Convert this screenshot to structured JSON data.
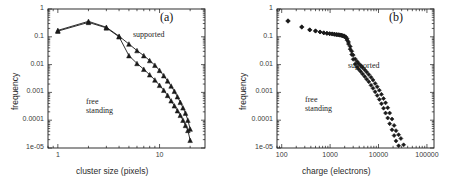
{
  "figure": {
    "background": "#ffffff",
    "ink_color": "#1a1a1a"
  },
  "chart_data": [
    {
      "type": "line",
      "panel_label": "(a)",
      "title": "",
      "xlabel": "cluster size (pixels)",
      "ylabel": "frequency",
      "xscale": "log",
      "yscale": "log",
      "xlim": [
        0.8,
        28
      ],
      "ylim": [
        1e-05,
        1
      ],
      "xticks": [
        1,
        10
      ],
      "xtick_labels": [
        "1",
        "10"
      ],
      "yticks": [
        1,
        0.1,
        0.01,
        0.001,
        0.0001,
        1e-05
      ],
      "ytick_labels": [
        "1",
        "0.1",
        "0.01",
        "0.001",
        "0.0001",
        "1e-05"
      ],
      "grid": false,
      "legend_position": "inline-annotation",
      "annotations": [
        {
          "text": "supported",
          "x": 7.0,
          "y": 0.12
        },
        {
          "text": "free\nstanding",
          "x": 4.0,
          "y": 0.0013
        }
      ],
      "marker": "triangle",
      "series": [
        {
          "name": "supported",
          "x": [
            1,
            2,
            3,
            4,
            5,
            6,
            7,
            8,
            9,
            10,
            11,
            12,
            13,
            14,
            15,
            16,
            17,
            18,
            19,
            20
          ],
          "values": [
            0.17,
            0.36,
            0.22,
            0.105,
            0.055,
            0.032,
            0.021,
            0.014,
            0.0095,
            0.0062,
            0.004,
            0.0026,
            0.0017,
            0.0011,
            0.0007,
            0.00044,
            0.00028,
            0.00018,
            0.0001,
            4.8e-05
          ]
        },
        {
          "name": "free standing",
          "x": [
            1,
            2,
            3,
            4,
            5,
            6,
            7,
            8,
            9,
            10,
            11,
            12,
            13,
            14,
            15,
            16,
            17,
            18,
            19,
            20
          ],
          "values": [
            0.16,
            0.33,
            0.21,
            0.1,
            0.021,
            0.011,
            0.0068,
            0.0043,
            0.0028,
            0.0018,
            0.0012,
            0.00078,
            0.0005,
            0.00033,
            0.00022,
            0.00015,
            0.0001,
            6.5e-05,
            4.3e-05,
            1.9e-05
          ]
        }
      ]
    },
    {
      "type": "scatter",
      "panel_label": "(b)",
      "title": "",
      "xlabel": "charge (electrons)",
      "ylabel": "frequency",
      "xscale": "log",
      "yscale": "log",
      "xlim": [
        80,
        140000
      ],
      "ylim": [
        1e-05,
        1
      ],
      "xticks": [
        100,
        1000,
        10000,
        100000
      ],
      "xtick_labels": [
        "100",
        "1000",
        "10000",
        "100000"
      ],
      "yticks": [
        1,
        0.1,
        0.01,
        0.001,
        0.0001,
        1e-05
      ],
      "ytick_labels": [
        "1",
        "0.1",
        "0.01",
        "0.001",
        "0.0001",
        "1e-05"
      ],
      "grid": false,
      "legend_position": "inline-annotation",
      "annotations": [
        {
          "text": "supported",
          "x": 9000,
          "y": 0.011
        },
        {
          "text": "free\nstanding",
          "x": 3100,
          "y": 0.0011
        }
      ],
      "marker": "diamond",
      "series": [
        {
          "name": "supported",
          "x": [
            135,
            260,
            380,
            500,
            620,
            740,
            860,
            980,
            1100,
            1220,
            1340,
            1460,
            1580,
            1700,
            1820,
            1950,
            2100,
            2250,
            2400,
            2600,
            2800,
            3000,
            3300,
            3600,
            3900,
            4300,
            4700,
            5200,
            5700,
            6300,
            7000,
            7700,
            8500,
            9400,
            10400,
            11500,
            12700,
            14000,
            15500,
            17000,
            19000,
            21000,
            23000,
            26000,
            29000,
            33000
          ],
          "values": [
            0.38,
            0.23,
            0.18,
            0.165,
            0.15,
            0.14,
            0.135,
            0.13,
            0.128,
            0.125,
            0.122,
            0.12,
            0.118,
            0.115,
            0.112,
            0.108,
            0.1,
            0.085,
            0.065,
            0.045,
            0.03,
            0.022,
            0.016,
            0.013,
            0.011,
            0.0092,
            0.0078,
            0.0065,
            0.0054,
            0.0044,
            0.0035,
            0.0028,
            0.0021,
            0.0016,
            0.0012,
            0.00085,
            0.0006,
            0.00042,
            0.00028,
            0.00018,
            0.00011,
            6.5e-05,
            4.2e-05,
            3e-05,
            2.2e-05,
            1.3e-05
          ]
        },
        {
          "name": "free standing",
          "x": [
            135,
            260,
            380,
            500,
            620,
            740,
            860,
            980,
            1100,
            1220,
            1340,
            1460,
            1580,
            1700,
            1820,
            1950,
            2100,
            2250,
            2400,
            2600,
            2800,
            3000,
            3300,
            3600,
            3900,
            4300,
            4700,
            5200,
            5700,
            6300,
            7000,
            7700,
            8500,
            9400,
            10400,
            11500,
            12700,
            14000,
            15500,
            17000,
            19000,
            21000,
            23000,
            26000
          ],
          "values": [
            0.36,
            0.22,
            0.175,
            0.16,
            0.148,
            0.138,
            0.132,
            0.128,
            0.125,
            0.122,
            0.119,
            0.117,
            0.114,
            0.111,
            0.107,
            0.102,
            0.093,
            0.075,
            0.055,
            0.036,
            0.023,
            0.0155,
            0.0105,
            0.0082,
            0.0068,
            0.0056,
            0.0046,
            0.0037,
            0.003,
            0.0024,
            0.0018,
            0.0014,
            0.00105,
            0.00078,
            0.00056,
            0.00039,
            0.00027,
            0.00018,
            0.00012,
            7.5e-05,
            4.5e-05,
            2.8e-05,
            1.8e-05,
            1.2e-05
          ]
        }
      ]
    }
  ]
}
